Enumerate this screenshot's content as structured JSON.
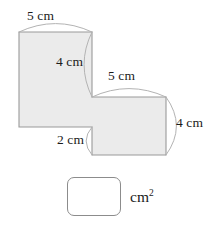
{
  "figure": {
    "shape_name": "stepped-l-polygon",
    "fill_color": "#ebebeb",
    "stroke_color": "#9a9a9a",
    "leader_color": "#b0b0b0",
    "labels": {
      "top": "5 cm",
      "left": "4 cm",
      "middle": "5 cm",
      "right": "4 cm",
      "bottom": "2 cm"
    }
  },
  "answer": {
    "value": "",
    "placeholder": "",
    "unit": "cm",
    "unit_exponent": "2"
  }
}
